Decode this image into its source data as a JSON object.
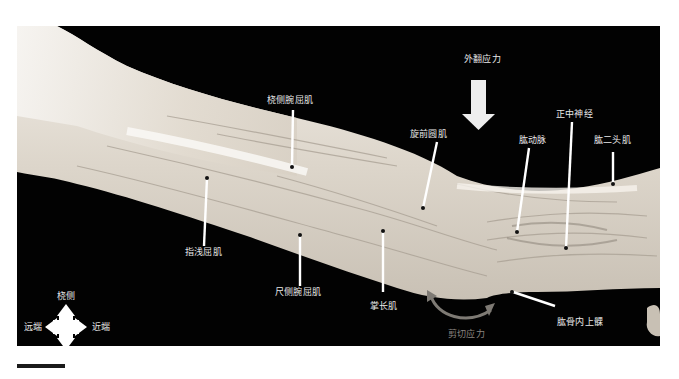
{
  "figure": {
    "background_color": "#020202",
    "tissue_color": "#e6e0d6",
    "arrow_color": "#eeeeee",
    "shear_arc_color": "#7e7a74"
  },
  "labels": {
    "valgus_stress": "外翻应力",
    "shear_stress": "剪切应力",
    "flexor_carpi_radialis": "桡侧腕屈肌",
    "pronator_teres": "旋前圆肌",
    "brachial_artery": "肱动脉",
    "median_nerve": "正中神经",
    "biceps_brachii": "肱二头肌",
    "flexor_digitorum_superficialis": "指浅屈肌",
    "flexor_carpi_ulnaris": "尺侧腕屈肌",
    "palmaris_longus": "掌长肌",
    "medial_epicondyle": "肱骨内上髁"
  },
  "compass": {
    "up": "桡侧",
    "down": "尺侧",
    "left": "远端",
    "right": "近端"
  }
}
